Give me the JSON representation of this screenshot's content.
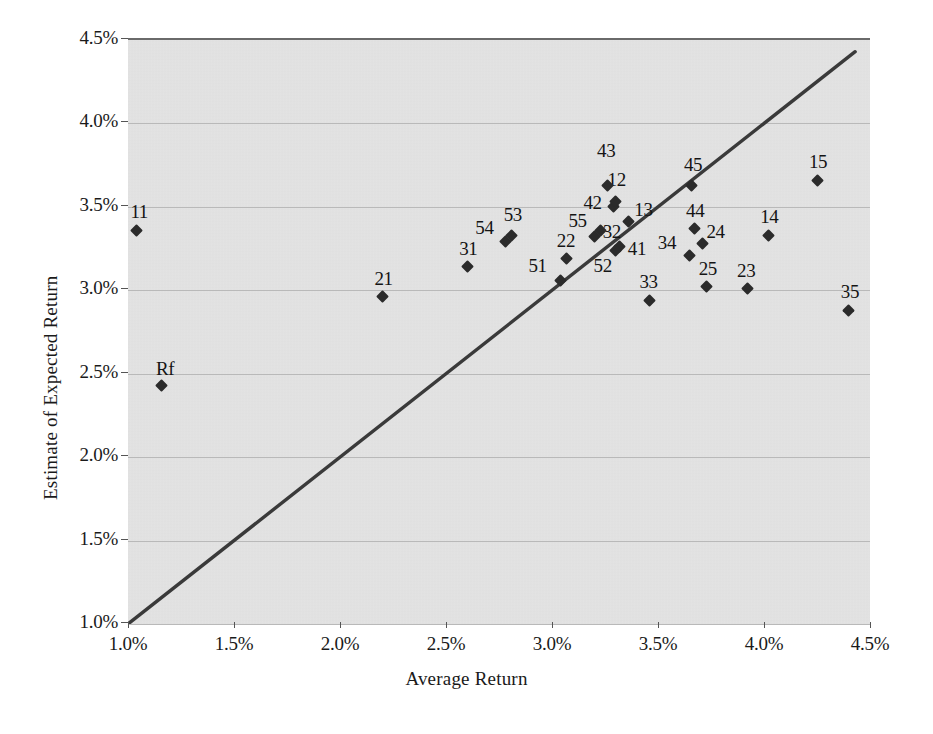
{
  "chart_data": {
    "type": "scatter",
    "title": "",
    "xlabel": "Average Return",
    "ylabel": "Estimate of Expected Return",
    "xlim": [
      1.0,
      4.5
    ],
    "ylim": [
      1.0,
      4.5
    ],
    "xtick_labels": [
      "1.0%",
      "1.5%",
      "2.0%",
      "2.5%",
      "3.0%",
      "3.5%",
      "4.0%",
      "4.5%"
    ],
    "xticks": [
      1.0,
      1.5,
      2.0,
      2.5,
      3.0,
      3.5,
      4.0,
      4.5
    ],
    "ytick_labels": [
      "1.0%",
      "1.5%",
      "2.0%",
      "2.5%",
      "3.0%",
      "3.5%",
      "4.0%",
      "4.5%"
    ],
    "yticks": [
      1.0,
      1.5,
      2.0,
      2.5,
      3.0,
      3.5,
      4.0,
      4.5
    ],
    "grid": "horizontal",
    "legend": "none",
    "plot_background": "#e3e3e3",
    "marker_color": "#2b2b2b",
    "line_color": "#3a3a3a",
    "reference_line": {
      "label": "45-degree line",
      "x": [
        1.0,
        4.43
      ],
      "y": [
        1.0,
        4.43
      ]
    },
    "points": [
      {
        "label": "Rf",
        "x": 1.16,
        "y": 2.43,
        "label_dx": -6,
        "label_dy": -26
      },
      {
        "label": "11",
        "x": 1.04,
        "y": 3.36,
        "label_dx": -6,
        "label_dy": -28
      },
      {
        "label": "21",
        "x": 2.2,
        "y": 2.96,
        "label_dx": -8,
        "label_dy": -28
      },
      {
        "label": "31",
        "x": 2.6,
        "y": 3.14,
        "label_dx": -8,
        "label_dy": -28
      },
      {
        "label": "54",
        "x": 2.78,
        "y": 3.29,
        "label_dx": -30,
        "label_dy": -24
      },
      {
        "label": "53",
        "x": 2.81,
        "y": 3.33,
        "label_dx": -8,
        "label_dy": -30
      },
      {
        "label": "22",
        "x": 3.07,
        "y": 3.19,
        "label_dx": -10,
        "label_dy": -28
      },
      {
        "label": "51",
        "x": 3.04,
        "y": 3.06,
        "label_dx": -32,
        "label_dy": -24
      },
      {
        "label": "55",
        "x": 3.2,
        "y": 3.32,
        "label_dx": -26,
        "label_dy": -26
      },
      {
        "label": "32",
        "x": 3.23,
        "y": 3.36,
        "label_dx": 2,
        "label_dy": -8
      },
      {
        "label": "42",
        "x": 3.29,
        "y": 3.5,
        "label_dx": -30,
        "label_dy": -14
      },
      {
        "label": "12",
        "x": 3.3,
        "y": 3.53,
        "label_dx": -8,
        "label_dy": -32
      },
      {
        "label": "43",
        "x": 3.26,
        "y": 3.63,
        "label_dx": -10,
        "label_dy": -44
      },
      {
        "label": "13",
        "x": 3.36,
        "y": 3.41,
        "label_dx": 6,
        "label_dy": -22
      },
      {
        "label": "41",
        "x": 3.32,
        "y": 3.26,
        "label_dx": 8,
        "label_dy": -8
      },
      {
        "label": "52",
        "x": 3.3,
        "y": 3.24,
        "label_dx": -22,
        "label_dy": 6
      },
      {
        "label": "33",
        "x": 3.46,
        "y": 2.94,
        "label_dx": -10,
        "label_dy": -28
      },
      {
        "label": "45",
        "x": 3.66,
        "y": 3.63,
        "label_dx": -8,
        "label_dy": -30
      },
      {
        "label": "44",
        "x": 3.67,
        "y": 3.37,
        "label_dx": -8,
        "label_dy": -28
      },
      {
        "label": "24",
        "x": 3.71,
        "y": 3.28,
        "label_dx": 4,
        "label_dy": -22
      },
      {
        "label": "34",
        "x": 3.65,
        "y": 3.21,
        "label_dx": -32,
        "label_dy": -22
      },
      {
        "label": "25",
        "x": 3.73,
        "y": 3.02,
        "label_dx": -8,
        "label_dy": -28
      },
      {
        "label": "23",
        "x": 3.92,
        "y": 3.01,
        "label_dx": -10,
        "label_dy": -28
      },
      {
        "label": "14",
        "x": 4.02,
        "y": 3.33,
        "label_dx": -8,
        "label_dy": -28
      },
      {
        "label": "15",
        "x": 4.25,
        "y": 3.66,
        "label_dx": -8,
        "label_dy": -28
      },
      {
        "label": "35",
        "x": 4.4,
        "y": 2.88,
        "label_dx": -8,
        "label_dy": -28
      }
    ]
  }
}
